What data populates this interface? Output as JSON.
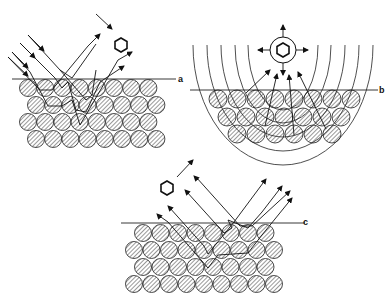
{
  "figure": {
    "panels": [
      {
        "id": "a",
        "label": "a",
        "description": "Specular and diffuse reflection of incoming radiation from layered atom surface; molecule above"
      },
      {
        "id": "b",
        "label": "b",
        "description": "Molecule emitting in all directions; spherical wavefronts reaching layered atoms and scattering back"
      },
      {
        "id": "c",
        "label": "c",
        "description": "Incoming radiation reflected from layered atom surface; molecule departing"
      }
    ],
    "colors": {
      "ink": "#111111",
      "background": "#ffffff"
    },
    "icons": [
      "hexagon-molecule-icon",
      "arrow-icon",
      "hatched-atom-icon"
    ]
  }
}
